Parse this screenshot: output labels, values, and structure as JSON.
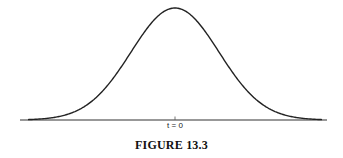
{
  "figure": {
    "caption": "FIGURE 13.3",
    "x_label": "t = 0"
  },
  "chart_data": {
    "type": "line",
    "title": "FIGURE 13.3",
    "xlabel": "",
    "ylabel": "",
    "x_ticks": [
      "t = 0"
    ],
    "x": [
      -3,
      -2.5,
      -2,
      -1.5,
      -1,
      -0.5,
      0,
      0.5,
      1,
      1.5,
      2,
      2.5,
      3
    ],
    "values": [
      0.011,
      0.044,
      0.135,
      0.325,
      0.607,
      0.882,
      1.0,
      0.882,
      0.607,
      0.325,
      0.135,
      0.044,
      0.011
    ],
    "grid": false,
    "legend": "none"
  }
}
